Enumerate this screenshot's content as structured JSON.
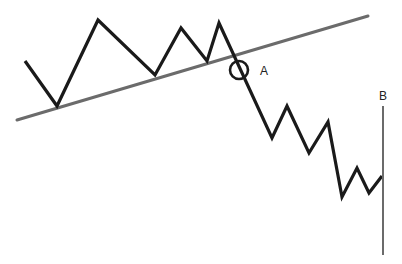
{
  "diagram": {
    "labels": {
      "a": "A",
      "b": "B"
    },
    "colors": {
      "price": "#1a1a1a",
      "trendline": "#6b6b6b",
      "marker": "#1a1a1a",
      "vline": "#6b6b6b"
    },
    "price_path": [
      [
        25,
        61
      ],
      [
        57,
        106
      ],
      [
        98,
        20
      ],
      [
        155,
        75
      ],
      [
        181,
        28
      ],
      [
        207,
        61
      ],
      [
        219,
        23
      ],
      [
        272,
        138
      ],
      [
        287,
        106
      ],
      [
        309,
        153
      ],
      [
        328,
        122
      ],
      [
        342,
        197
      ],
      [
        357,
        168
      ],
      [
        369,
        193
      ],
      [
        382,
        176
      ]
    ],
    "trendline": [
      [
        17,
        120
      ],
      [
        368,
        16
      ]
    ],
    "break_marker": {
      "cx": 239,
      "cy": 70,
      "r": 9
    },
    "vertical_line": {
      "x": 383,
      "y1": 106,
      "y2": 255
    }
  }
}
